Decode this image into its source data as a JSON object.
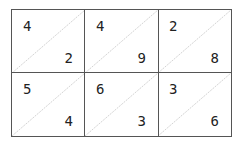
{
  "lattice": {
    "rows": [
      [
        {
          "tens": "4",
          "ones": "2"
        },
        {
          "tens": "4",
          "ones": "9"
        },
        {
          "tens": "2",
          "ones": "8"
        }
      ],
      [
        {
          "tens": "5",
          "ones": "4"
        },
        {
          "tens": "6",
          "ones": "3"
        },
        {
          "tens": "3",
          "ones": "6"
        }
      ]
    ]
  }
}
